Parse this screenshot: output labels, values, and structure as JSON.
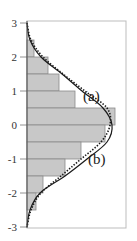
{
  "chart_data": {
    "type": "bar",
    "orientation": "horizontal",
    "title": "",
    "xlabel": "",
    "ylabel": "",
    "ylim": [
      -3,
      3
    ],
    "yticks": [
      3,
      2,
      1,
      0,
      -1,
      -2,
      -3
    ],
    "ytick_labels": [
      "3",
      "2",
      "1",
      "0",
      "-1",
      "-2",
      "-3"
    ],
    "grid": false,
    "bins": [
      {
        "from": 2.5,
        "to": 2.0,
        "value": 7
      },
      {
        "from": 2.0,
        "to": 1.5,
        "value": 21
      },
      {
        "from": 1.5,
        "to": 1.0,
        "value": 32
      },
      {
        "from": 1.0,
        "to": 0.5,
        "value": 48
      },
      {
        "from": 0.5,
        "to": 0.0,
        "value": 88
      },
      {
        "from": 0.0,
        "to": -0.5,
        "value": 78
      },
      {
        "from": -0.5,
        "to": -1.0,
        "value": 54
      },
      {
        "from": -1.0,
        "to": -1.5,
        "value": 38
      },
      {
        "from": -1.5,
        "to": -2.0,
        "value": 16
      },
      {
        "from": -2.0,
        "to": -2.5,
        "value": 9
      }
    ],
    "series": [
      {
        "name": "(a)",
        "style": "dotted",
        "y": [
          3,
          2.5,
          2,
          1.5,
          1,
          0.5,
          0,
          -0.5,
          -1,
          -1.5,
          -2,
          -2.5,
          -3
        ],
        "values": [
          0,
          4,
          16,
          36,
          58,
          80,
          83,
          74,
          54,
          34,
          14,
          4,
          0
        ]
      },
      {
        "name": "(b)",
        "style": "solid",
        "y": [
          3,
          2.5,
          2,
          1.5,
          1,
          0.5,
          0,
          -0.5,
          -1,
          -1.5,
          -2,
          -2.5,
          -3
        ],
        "values": [
          0,
          3,
          14,
          35,
          55,
          76,
          85,
          80,
          60,
          38,
          13,
          3,
          0
        ]
      }
    ],
    "annotations": [
      {
        "text": "(a)",
        "near_y": 0.85
      },
      {
        "text": "(b)",
        "near_y": -1.0
      }
    ],
    "colors": {
      "bar_fill": "#c8c8c8",
      "bar_edge": "#8a8a8a",
      "frame": "#bbbbbb",
      "curve": "#1a1a1a"
    }
  },
  "labels": {
    "ticks": [
      "3",
      "2",
      "1",
      "0",
      "-1",
      "-2",
      "-3"
    ],
    "curve_a": "(a)",
    "curve_b": "(b)"
  }
}
